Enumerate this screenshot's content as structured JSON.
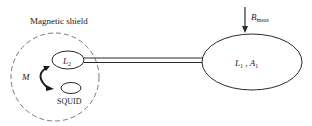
{
  "diagram": {
    "shield_label": "Magnetic shield",
    "pickup_loop": {
      "symbol": "L",
      "sub1": "1",
      "sep": " , ",
      "area_symbol": "A",
      "sub2": "1"
    },
    "input_coil": {
      "symbol": "L",
      "sub": "2"
    },
    "squid_label": "SQUID",
    "mutual_label": "M",
    "field": {
      "symbol": "B",
      "sub": "meas"
    },
    "colors": {
      "stroke": "#2a2a2a",
      "dashed": "#777777",
      "text": "#222222"
    }
  }
}
